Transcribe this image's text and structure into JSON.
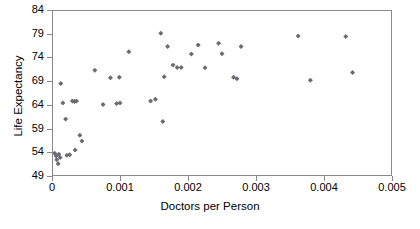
{
  "chart_data": {
    "type": "scatter",
    "title": "",
    "xlabel": "Doctors per Person",
    "ylabel": "Life Expectancy",
    "xlim": [
      0,
      0.005
    ],
    "ylim": [
      49,
      84
    ],
    "xticks": [
      "0",
      "0.001",
      "0.002",
      "0.003",
      "0.004",
      "0.005"
    ],
    "xtick_values": [
      0,
      0.001,
      0.002,
      0.003,
      0.004,
      0.005
    ],
    "yticks": [
      "49",
      "54",
      "59",
      "64",
      "69",
      "74",
      "79",
      "84"
    ],
    "ytick_values": [
      49,
      54,
      59,
      64,
      69,
      74,
      79,
      84
    ],
    "grid": false,
    "legend": false,
    "marker": "diamond",
    "marker_color": "#6b6b72",
    "frame_color": "#8a8a8a",
    "points": [
      {
        "x": 4e-05,
        "y": 53.8
      },
      {
        "x": 6e-05,
        "y": 53.2
      },
      {
        "x": 7e-05,
        "y": 52.4
      },
      {
        "x": 9e-05,
        "y": 51.6
      },
      {
        "x": 0.0001,
        "y": 53.6
      },
      {
        "x": 0.00012,
        "y": 52.9
      },
      {
        "x": 0.00013,
        "y": 68.5
      },
      {
        "x": 0.00016,
        "y": 64.4
      },
      {
        "x": 0.0002,
        "y": 61.0
      },
      {
        "x": 0.00022,
        "y": 53.4
      },
      {
        "x": 0.00026,
        "y": 53.5
      },
      {
        "x": 0.0003,
        "y": 64.8
      },
      {
        "x": 0.00033,
        "y": 64.7
      },
      {
        "x": 0.00034,
        "y": 54.5
      },
      {
        "x": 0.00036,
        "y": 64.8
      },
      {
        "x": 0.00041,
        "y": 57.6
      },
      {
        "x": 0.00044,
        "y": 56.4
      },
      {
        "x": 0.00063,
        "y": 71.3
      },
      {
        "x": 0.00075,
        "y": 64.1
      },
      {
        "x": 0.00086,
        "y": 69.7
      },
      {
        "x": 0.00095,
        "y": 64.3
      },
      {
        "x": 0.00099,
        "y": 69.8
      },
      {
        "x": 0.001,
        "y": 64.4
      },
      {
        "x": 0.00113,
        "y": 75.2
      },
      {
        "x": 0.00145,
        "y": 64.8
      },
      {
        "x": 0.00152,
        "y": 65.2
      },
      {
        "x": 0.0016,
        "y": 79.1
      },
      {
        "x": 0.00163,
        "y": 60.5
      },
      {
        "x": 0.00165,
        "y": 69.9
      },
      {
        "x": 0.0017,
        "y": 76.3
      },
      {
        "x": 0.00178,
        "y": 72.4
      },
      {
        "x": 0.00184,
        "y": 71.9
      },
      {
        "x": 0.0019,
        "y": 71.9
      },
      {
        "x": 0.00205,
        "y": 74.7
      },
      {
        "x": 0.00215,
        "y": 76.6
      },
      {
        "x": 0.00225,
        "y": 71.8
      },
      {
        "x": 0.00245,
        "y": 77.0
      },
      {
        "x": 0.0025,
        "y": 74.8
      },
      {
        "x": 0.00267,
        "y": 69.8
      },
      {
        "x": 0.00272,
        "y": 69.5
      },
      {
        "x": 0.00278,
        "y": 76.3
      },
      {
        "x": 0.00362,
        "y": 78.5
      },
      {
        "x": 0.0038,
        "y": 69.2
      },
      {
        "x": 0.00432,
        "y": 78.4
      },
      {
        "x": 0.00442,
        "y": 70.8
      }
    ]
  }
}
